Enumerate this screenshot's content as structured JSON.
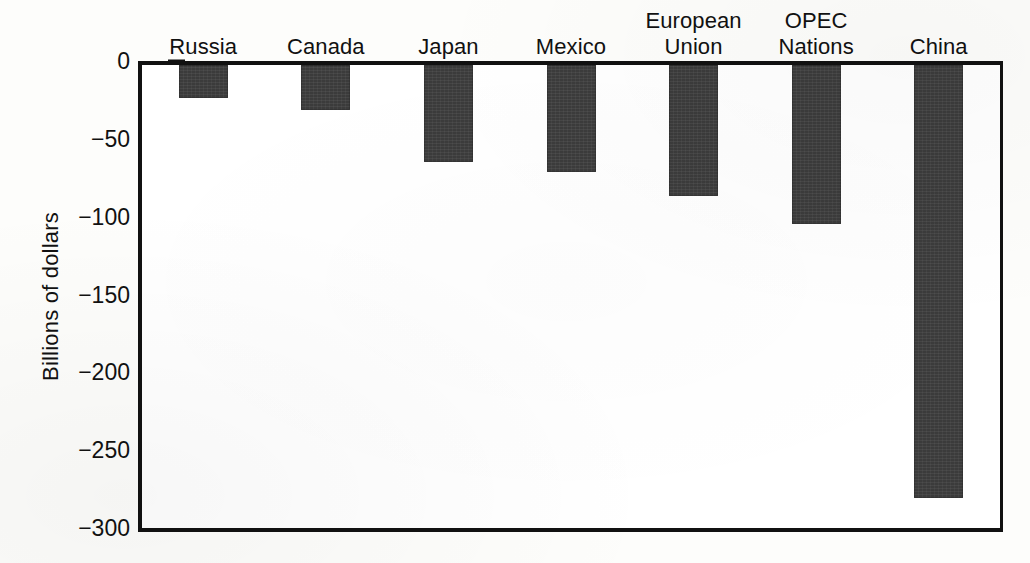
{
  "chart_data": {
    "type": "bar",
    "title": "",
    "subtitle": "",
    "xlabel": "",
    "ylabel": "Billions of dollars",
    "categories": [
      "Russia",
      "Canada",
      "Japan",
      "Mexico",
      "European Union",
      "OPEC Nations",
      "China"
    ],
    "category_lines": [
      [
        "Russia"
      ],
      [
        "Canada"
      ],
      [
        "Japan"
      ],
      [
        "Mexico"
      ],
      [
        "European",
        "Union"
      ],
      [
        "OPEC",
        "Nations"
      ],
      [
        "China"
      ]
    ],
    "values": [
      -21,
      -29,
      -62,
      -69,
      -84,
      -102,
      -278
    ],
    "ylim": [
      -300,
      0
    ],
    "ytick_values": [
      0,
      -50,
      -100,
      -150,
      -200,
      -250,
      -300
    ],
    "ytick_labels": [
      "0",
      "−50",
      "−100",
      "−150",
      "−200",
      "−250",
      "−300"
    ],
    "grid": false,
    "legend": null,
    "bar_color": "#3b3b3b",
    "axis_color": "#111111",
    "plot_background": "#ffffff"
  },
  "figure": {
    "axis_label_y": "Billions of dollars"
  }
}
